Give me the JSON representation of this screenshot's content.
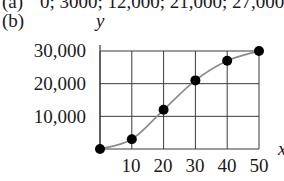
{
  "part_a": {
    "label": "(a)",
    "text": "0; 3000; 12,000; 21,000; 27,000; 30,000"
  },
  "part_b": {
    "label": "(b)"
  },
  "chart_data": {
    "type": "line",
    "title": "",
    "xlabel": "x",
    "ylabel": "y",
    "x": [
      0,
      10,
      20,
      30,
      40,
      50
    ],
    "series": [
      {
        "name": "y",
        "values": [
          0,
          3000,
          12000,
          21000,
          27000,
          30000
        ]
      }
    ],
    "x_ticks": [
      "10",
      "20",
      "30",
      "40",
      "50"
    ],
    "y_ticks": [
      "10,000",
      "20,000",
      "30,000"
    ],
    "xlim": [
      0,
      50
    ],
    "ylim": [
      0,
      30000
    ],
    "grid": true,
    "markers": "filled-circle",
    "curve": "smooth",
    "legend": "none",
    "colors": {
      "curve": "#8a8a8a",
      "grid": "#3a3a3a",
      "marker": "#000000"
    }
  }
}
